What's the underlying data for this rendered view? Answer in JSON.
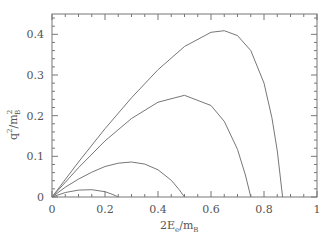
{
  "chart_data": {
    "type": "line",
    "title": "",
    "xlabel": "2E_e/m_B",
    "ylabel": "q^2/m_B^2",
    "xlabel_parts": {
      "main": "2E",
      "sub": "e",
      "slash": "/m",
      "sub2": "B"
    },
    "ylabel_parts": {
      "main": "q",
      "sup": "2",
      "slash": "/m",
      "sup2": "2",
      "sub2": "B"
    },
    "xlim": [
      0,
      1
    ],
    "ylim": [
      0,
      0.45
    ],
    "x_ticks": [
      0,
      0.2,
      0.4,
      0.6,
      0.8,
      1
    ],
    "x_tick_labels": [
      "0",
      "0.2",
      "0.4",
      "0.6",
      "0.8",
      "1"
    ],
    "y_ticks": [
      0,
      0.1,
      0.2,
      0.3,
      0.4
    ],
    "y_tick_labels": [
      "0",
      "0.1",
      "0.2",
      "0.3",
      "0.4"
    ],
    "grid": false,
    "legend": null,
    "series": [
      {
        "name": "curve-1",
        "x": [
          0,
          0.1,
          0.2,
          0.3,
          0.4,
          0.5,
          0.6,
          0.65,
          0.7,
          0.75,
          0.8,
          0.83,
          0.85,
          0.87
        ],
        "y": [
          0,
          0.086,
          0.168,
          0.244,
          0.313,
          0.37,
          0.405,
          0.409,
          0.397,
          0.36,
          0.28,
          0.195,
          0.113,
          0
        ]
      },
      {
        "name": "curve-2",
        "x": [
          0,
          0.1,
          0.2,
          0.3,
          0.4,
          0.5,
          0.6,
          0.65,
          0.7,
          0.73,
          0.75
        ],
        "y": [
          0,
          0.072,
          0.138,
          0.193,
          0.233,
          0.25,
          0.225,
          0.186,
          0.117,
          0.054,
          0
        ]
      },
      {
        "name": "curve-3",
        "x": [
          0,
          0.05,
          0.1,
          0.15,
          0.2,
          0.25,
          0.3,
          0.35,
          0.4,
          0.45,
          0.48,
          0.5
        ],
        "y": [
          0,
          0.024,
          0.044,
          0.061,
          0.075,
          0.083,
          0.086,
          0.081,
          0.067,
          0.041,
          0.018,
          0
        ]
      },
      {
        "name": "curve-4",
        "x": [
          0,
          0.05,
          0.1,
          0.15,
          0.2,
          0.23,
          0.25
        ],
        "y": [
          0,
          0.011,
          0.017,
          0.018,
          0.013,
          0.006,
          0
        ]
      }
    ]
  },
  "plot": {
    "left": 52,
    "right": 317,
    "top": 14,
    "bottom": 197,
    "color": "#777777"
  }
}
